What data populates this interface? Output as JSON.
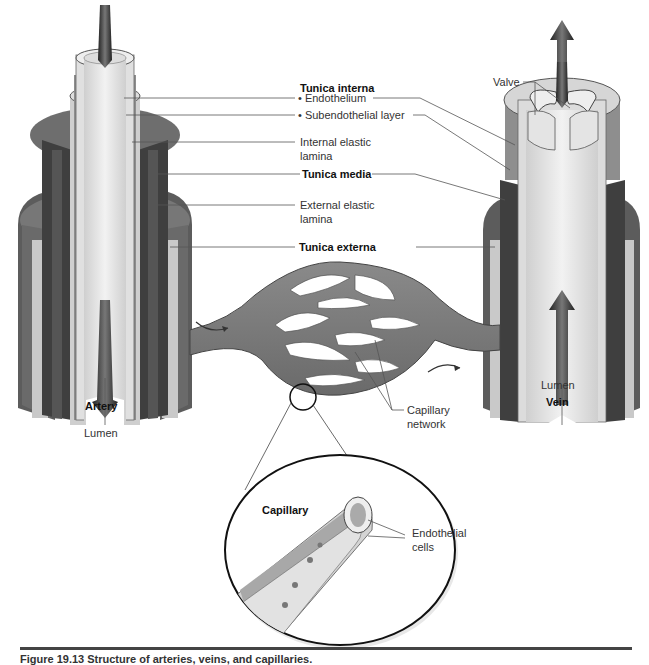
{
  "figure": {
    "caption": "Figure 19.13 Structure of arteries, veins, and capillaries.",
    "caption_visibility": "cut off at bottom edge; only top sliver visible"
  },
  "labels": {
    "tunica_interna": "Tunica interna",
    "endothelium": "• Endothelium",
    "subendothelial": "• Subendothelial layer",
    "internal_elastic_1": "Internal elastic",
    "internal_elastic_2": "lamina",
    "tunica_media": "Tunica media",
    "external_elastic_1": "External elastic",
    "external_elastic_2": "lamina",
    "tunica_externa": "Tunica externa",
    "valve": "Valve",
    "artery_lumen": "Lumen",
    "artery": "Artery",
    "vein_lumen": "Lumen",
    "vein": "Vein",
    "capillary_network_1": "Capillary",
    "capillary_network_2": "network",
    "capillary": "Capillary",
    "endothelial_cells_1": "Endothelial",
    "endothelial_cells_2": "cells"
  },
  "colors": {
    "background": "#ffffff",
    "lumen": "#e6e6e6",
    "endothelium": "#d8d8d8",
    "media_dark": "#4a4a4a",
    "media_mid": "#6e6e6e",
    "externa": "#8c8c8c",
    "externa_light": "#c9c9c9",
    "capillary_bed": "#7a7a7a",
    "leader_line": "#555555",
    "arrow": "#3a3a3a"
  }
}
